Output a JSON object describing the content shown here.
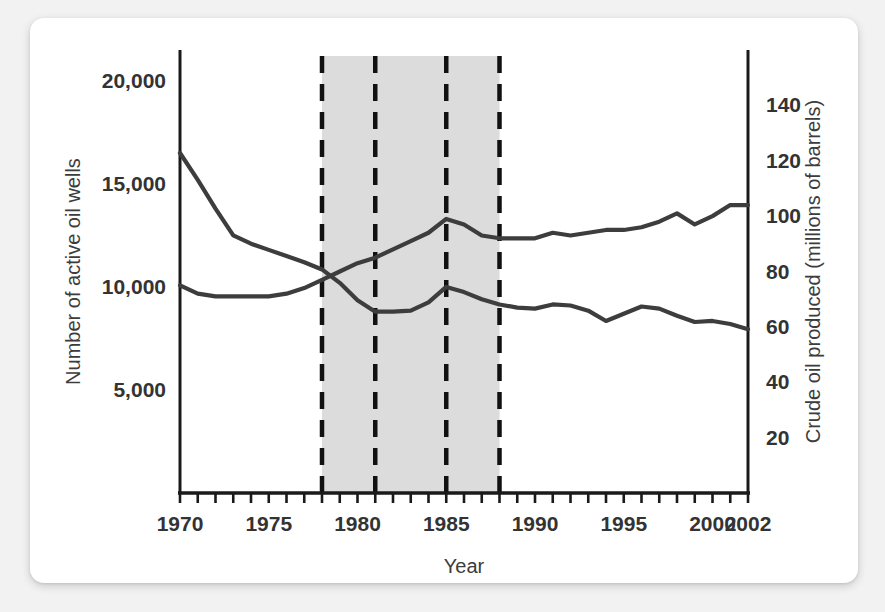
{
  "chart_data": {
    "type": "line",
    "title": "",
    "xlabel": "Year",
    "ylabel_left": "Number of active oil wells",
    "ylabel_right": "Crude oil produced (millions of barrels)",
    "grid": false,
    "legend": "none",
    "xlim": [
      1970,
      2002
    ],
    "x_ticks_major": [
      1970,
      1975,
      1980,
      1985,
      1990,
      1995,
      2000,
      2002
    ],
    "x_tick_labels": [
      "1970",
      "1975",
      "1980",
      "1985",
      "1990",
      "1995",
      "2000",
      "2002"
    ],
    "x_ticks_minor_step": 1,
    "ylim_left": [
      0,
      21500
    ],
    "y_ticks_left": [
      5000,
      10000,
      15000,
      20000
    ],
    "y_tick_labels_left": [
      "5,000",
      "10,000",
      "15,000",
      "20,000"
    ],
    "ylim_right": [
      0,
      160
    ],
    "y_ticks_right": [
      20,
      40,
      60,
      80,
      100,
      120,
      140
    ],
    "y_tick_labels_right": [
      "20",
      "40",
      "60",
      "80",
      "100",
      "120",
      "140"
    ],
    "shaded_region": {
      "start": 1978,
      "end": 1988,
      "color": "#dcdcdc"
    },
    "dashed_lines": [
      1978,
      1981,
      1985,
      1988
    ],
    "line_color": "#3d3d3d",
    "x": [
      1970,
      1971,
      1972,
      1973,
      1974,
      1975,
      1976,
      1977,
      1978,
      1979,
      1980,
      1981,
      1982,
      1983,
      1984,
      1985,
      1986,
      1987,
      1988,
      1989,
      1990,
      1991,
      1992,
      1993,
      1994,
      1995,
      1996,
      1997,
      1998,
      1999,
      2000,
      2001,
      2002
    ],
    "series": [
      {
        "name": "Number of active oil wells",
        "axis": "left",
        "values": [
          16500,
          15200,
          13800,
          12500,
          12100,
          11800,
          11500,
          11200,
          10850,
          10200,
          9350,
          8800,
          8800,
          8850,
          9250,
          10000,
          9750,
          9400,
          9150,
          9000,
          8950,
          9150,
          9100,
          8850,
          8350,
          8700,
          9050,
          8950,
          8600,
          8300,
          8350,
          8200,
          7950
        ]
      },
      {
        "name": "Crude oil produced (millions of barrels)",
        "axis": "right",
        "values": [
          75,
          72,
          71,
          71,
          71,
          71,
          72,
          74,
          77,
          80,
          83,
          85,
          88,
          91,
          94,
          99,
          97,
          93,
          92,
          92,
          92,
          94,
          93,
          94,
          95,
          95,
          96,
          98,
          101,
          97,
          100,
          104,
          104
        ]
      }
    ]
  }
}
